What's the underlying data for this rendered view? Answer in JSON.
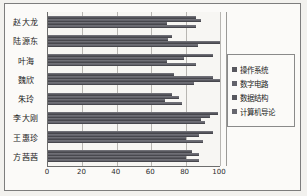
{
  "chart_data": {
    "type": "bar",
    "orientation": "horizontal",
    "title": "",
    "xlabel": "",
    "ylabel": "",
    "xlim": [
      0,
      100
    ],
    "xticks": [
      0,
      20,
      40,
      60,
      80,
      100
    ],
    "grid": true,
    "legend_position": "right",
    "categories": [
      "赵大龙",
      "陆源东",
      "叶海",
      "魏欣",
      "朱玲",
      "李大刚",
      "王惠珍",
      "方茜茜"
    ],
    "series": [
      {
        "name": "操作系统",
        "color": "#57575e",
        "values": [
          86,
          72,
          96,
          73,
          72,
          99,
          96,
          84
        ]
      },
      {
        "name": "数字电路",
        "color": "#62626a",
        "values": [
          89,
          70,
          79,
          96,
          76,
          94,
          88,
          88
        ]
      },
      {
        "name": "数据结构",
        "color": "#58585f",
        "values": [
          69,
          100,
          69,
          100,
          68,
          89,
          80,
          80
        ]
      },
      {
        "name": "计算机导论",
        "color": "#66666e",
        "values": [
          86,
          87,
          86,
          85,
          78,
          91,
          90,
          88
        ]
      }
    ]
  },
  "legend": {
    "items": [
      {
        "label": "操作系统"
      },
      {
        "label": "数字电路"
      },
      {
        "label": "数据结构"
      },
      {
        "label": "计算机导论"
      }
    ]
  },
  "axis": {
    "x_tick_labels": [
      "0",
      "20",
      "40",
      "60",
      "80",
      "100"
    ]
  },
  "colors": {
    "bar": "#5a5a61",
    "frame": "#7d7d7d",
    "plot_background": "#f7f6f3",
    "page_background": "#f2f1ee",
    "gridline": "#b8b6b2",
    "text": "#1c1c1c"
  }
}
